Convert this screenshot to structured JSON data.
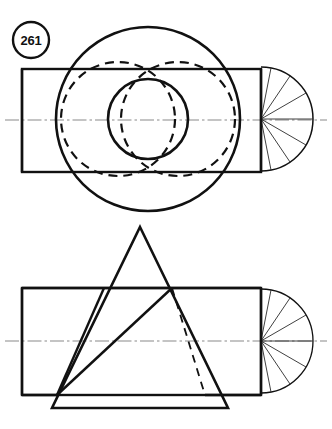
{
  "sheet": {
    "width": 332,
    "height": 429,
    "background": "#ffffff",
    "ink_color": "#111111",
    "centerline_color": "#8a8a8a",
    "thin_line_color": "#2a2a2a",
    "title": "261"
  },
  "figure_label": {
    "text": "261",
    "shape": "circle-badge",
    "center_x": 31,
    "center_y": 40,
    "radius": 18
  },
  "views": [
    {
      "name": "top-view",
      "description": "Front view with rectangle, full circle, inner circle and hidden dashed circles plus end fan",
      "rectangle": {
        "x": 22,
        "y": 69,
        "width": 239,
        "height": 103
      },
      "centerline": {
        "y": 120,
        "x_start": 5,
        "x_end": 327,
        "pattern": "dash-dot"
      },
      "large_circle": {
        "cx": 148,
        "cy": 119,
        "r": 92,
        "style": "solid",
        "stroke_width": 2.6
      },
      "small_circle": {
        "cx": 148,
        "cy": 119,
        "r": 40,
        "style": "solid",
        "stroke_width": 2.6
      },
      "hidden_circles": [
        {
          "cx": 118,
          "cy": 119,
          "r": 57,
          "style": "dashed"
        },
        {
          "cx": 178,
          "cy": 119,
          "r": 57,
          "style": "dashed"
        }
      ],
      "end_fan": {
        "cx": 261,
        "cy": 119,
        "r": 52,
        "spoke_count": 7,
        "style": "thin-solid",
        "description": "right semicircular fan with radial spokes"
      }
    },
    {
      "name": "bottom-view",
      "description": "Second view with rectangle, overlapping solid triangle, hidden dashed line and end fan",
      "rectangle": {
        "x": 22,
        "y": 288,
        "width": 239,
        "height": 107
      },
      "centerline": {
        "y": 341,
        "x_start": 5,
        "x_end": 327,
        "pattern": "dash-dot"
      },
      "triangle": {
        "apex_x": 140,
        "apex_y": 227,
        "base_left_x": 52,
        "base_right_x": 228,
        "base_y": 408,
        "style": "solid",
        "stroke_width": 2.6
      },
      "cross_lines": [
        {
          "x1": 104,
          "y1": 288,
          "x2": 57,
          "y2": 395,
          "style": "solid"
        },
        {
          "x1": 57,
          "y1": 395,
          "x2": 172,
          "y2": 288,
          "style": "solid"
        }
      ],
      "hidden_line": {
        "x1": 172,
        "y1": 288,
        "x2": 205,
        "y2": 395,
        "style": "dashed"
      },
      "end_fan": {
        "cx": 261,
        "cy": 341,
        "r": 52,
        "spoke_count": 7,
        "style": "thin-solid",
        "description": "right semicircular fan with radial spokes"
      }
    }
  ]
}
